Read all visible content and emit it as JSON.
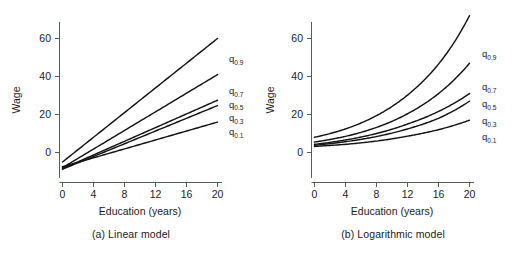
{
  "figure": {
    "background_color": "#ffffff",
    "line_color": "#141414",
    "axis_color": "#555c5f",
    "text_color": "#1c1c1c"
  },
  "panels": [
    {
      "id": "panel-a",
      "caption": "(a) Linear model",
      "xlabel": "Education (years)",
      "ylabel": "Wage",
      "xticks": [
        "0",
        "4",
        "8",
        "12",
        "16",
        "20"
      ],
      "yticks": [
        "0",
        "20",
        "40",
        "60"
      ],
      "series_labels": [
        "q",
        "q",
        "q",
        "q",
        "q"
      ],
      "series_subscripts": [
        "0.9",
        "0.7",
        "0.5",
        "0.3",
        "0.1"
      ]
    },
    {
      "id": "panel-b",
      "caption": "(b) Logarithmic model",
      "xlabel": "Education (years)",
      "ylabel": "Wage",
      "xticks": [
        "0",
        "4",
        "8",
        "12",
        "16",
        "20"
      ],
      "yticks": [
        "0",
        "20",
        "40",
        "60"
      ],
      "series_labels": [
        "q",
        "q",
        "q",
        "q",
        "q"
      ],
      "series_subscripts": [
        "0.9",
        "0.7",
        "0.5",
        "0.3",
        "0.1"
      ]
    }
  ],
  "chart_data": [
    {
      "type": "line",
      "panel": "a",
      "title": "(a) Linear model",
      "xlabel": "Education (years)",
      "ylabel": "Wage",
      "xlim": [
        -1.2,
        21.5
      ],
      "ylim": [
        -11,
        70
      ],
      "xticks": [
        0,
        4,
        8,
        12,
        16,
        20
      ],
      "yticks": [
        0,
        20,
        40,
        60
      ],
      "grid": false,
      "legend": "inline-right-end-labels",
      "x": [
        0,
        4,
        8,
        12,
        16,
        20
      ],
      "series": [
        {
          "name": "q_0.9",
          "label": "q",
          "subscript": "0.9",
          "values": [
            -5.0,
            8.0,
            21.0,
            34.0,
            47.0,
            60.0
          ]
        },
        {
          "name": "q_0.7",
          "label": "q",
          "subscript": "0.7",
          "values": [
            -8.0,
            1.8,
            11.6,
            21.4,
            31.2,
            41.0
          ]
        },
        {
          "name": "q_0.5",
          "label": "q",
          "subscript": "0.5",
          "values": [
            -8.5,
            -1.3,
            5.9,
            13.1,
            20.3,
            27.5
          ]
        },
        {
          "name": "q_0.3",
          "label": "q",
          "subscript": "0.3",
          "values": [
            -8.8,
            -2.1,
            4.6,
            11.3,
            18.0,
            24.7
          ]
        },
        {
          "name": "q_0.1",
          "label": "q",
          "subscript": "0.1",
          "values": [
            -7.5,
            -1.6,
            2.3,
            7.0,
            11.5,
            16.0
          ]
        }
      ]
    },
    {
      "type": "line",
      "panel": "b",
      "title": "(b) Logarithmic model",
      "xlabel": "Education (years)",
      "ylabel": "Wage",
      "xlim": [
        -1.2,
        21.5
      ],
      "ylim": [
        -11,
        78
      ],
      "xticks": [
        0,
        4,
        8,
        12,
        16,
        20
      ],
      "yticks": [
        0,
        20,
        40,
        60
      ],
      "grid": false,
      "legend": "inline-right-end-labels",
      "x": [
        0,
        4,
        8,
        12,
        16,
        20
      ],
      "series": [
        {
          "name": "q_0.9",
          "label": "q",
          "subscript": "0.9",
          "values": [
            8.0,
            12.4,
            19.4,
            30.2,
            46.5,
            72.0
          ]
        },
        {
          "name": "q_0.7",
          "label": "q",
          "subscript": "0.7",
          "values": [
            5.5,
            8.5,
            13.2,
            20.4,
            31.0,
            47.0
          ]
        },
        {
          "name": "q_0.5",
          "label": "q",
          "subscript": "0.5",
          "values": [
            4.3,
            6.6,
            10.0,
            15.0,
            21.6,
            31.0
          ]
        },
        {
          "name": "q_0.3",
          "label": "q",
          "subscript": "0.3",
          "values": [
            3.8,
            5.7,
            8.4,
            12.4,
            18.0,
            27.0
          ]
        },
        {
          "name": "q_0.1",
          "label": "q",
          "subscript": "0.1",
          "values": [
            3.2,
            4.3,
            6.0,
            8.6,
            12.0,
            17.0
          ]
        }
      ]
    }
  ]
}
